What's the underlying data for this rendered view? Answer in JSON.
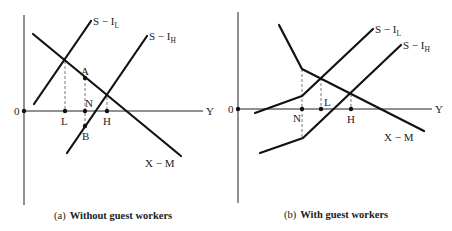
{
  "figure": {
    "panels": [
      {
        "id": "a",
        "caption_prefix": "(a)",
        "caption_text": "Without guest workers",
        "origin_label": "0",
        "x_axis_label": "Y",
        "curves": [
          {
            "name": "S − I_L",
            "label_main": "S − I",
            "label_sub": "L"
          },
          {
            "name": "S − I_H",
            "label_main": "S − I",
            "label_sub": "H"
          },
          {
            "name": "X − M",
            "label_main": "X − M"
          }
        ],
        "points": {
          "A": "A",
          "B": "B",
          "N": "N",
          "L": "L",
          "H": "H"
        }
      },
      {
        "id": "b",
        "caption_prefix": "(b)",
        "caption_text": "With guest workers",
        "origin_label": "0",
        "x_axis_label": "Y",
        "curves": [
          {
            "name": "S − I_L",
            "label_main": "S − I",
            "label_sub": "L"
          },
          {
            "name": "S − I_H",
            "label_main": "S − I",
            "label_sub": "H"
          },
          {
            "name": "X − M",
            "label_main": "X − M"
          }
        ],
        "points": {
          "N": "N",
          "L": "L",
          "H": "H"
        }
      }
    ]
  }
}
